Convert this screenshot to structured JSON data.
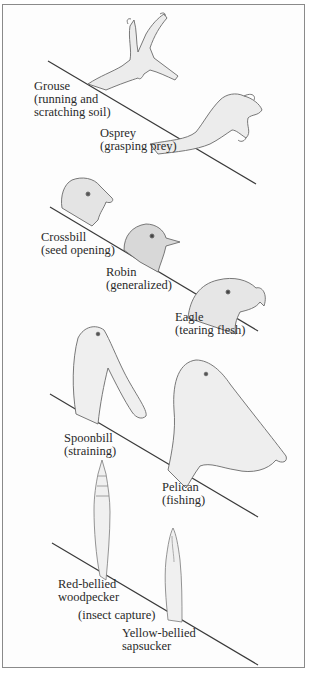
{
  "figure": {
    "panels": [
      {
        "id": "feet",
        "items": [
          {
            "name": "Grouse",
            "function": "(running and",
            "function2": "scratching soil)"
          },
          {
            "name": "Osprey",
            "function": "(grasping prey)"
          }
        ]
      },
      {
        "id": "beaks-heads",
        "items": [
          {
            "name": "Crossbill",
            "function": "(seed opening)"
          },
          {
            "name": "Robin",
            "function": "(generalized)"
          },
          {
            "name": "Eagle",
            "function": "(tearing flesh)"
          }
        ]
      },
      {
        "id": "beaks-water",
        "items": [
          {
            "name": "Spoonbill",
            "function": "(straining)"
          },
          {
            "name": "Pelican",
            "function": "(fishing)"
          }
        ]
      },
      {
        "id": "tongues",
        "items": [
          {
            "name": "Red-bellied",
            "name2": "woodpecker"
          },
          {
            "name": "Yellow-bellied",
            "name2": "sapsucker"
          }
        ],
        "shared_function": "(insect capture)"
      }
    ],
    "colors": {
      "border": "#8a8a8a",
      "line": "#3a3a3a",
      "text": "#2a2a2a",
      "sketch": "#6a6a6a",
      "shade": "#d8d8d8"
    }
  }
}
